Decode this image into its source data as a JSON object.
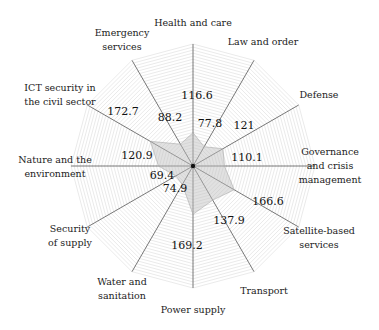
{
  "chart_data": {
    "type": "radar",
    "title": "",
    "center": [
      193,
      166
    ],
    "outer_radius_px": 122,
    "rmax": 427,
    "grid_rings": 40,
    "grid_color": "#d4d4d4",
    "axis_color": "#555555",
    "fill_color": "#bdbdbd",
    "fill_opacity": 0.45,
    "categories": [
      "Health and care",
      "Law and order",
      "Defense",
      "Governance and crisis management",
      "Satellite-based services",
      "Transport",
      "Power supply",
      "Water and sanitation",
      "Security of supply",
      "Nature and the environment",
      "ICT security in the civil sector",
      "Emergency services"
    ],
    "values": [
      116.6,
      77.8,
      121,
      110.1,
      166.6,
      137.9,
      169.2,
      74.9,
      69.4,
      120.9,
      172.7,
      88.2
    ],
    "value_labels": [
      "116.6",
      "77.8",
      "121",
      "110.1",
      "166.6",
      "137.9",
      "169.2",
      "74.9",
      "69.4",
      "120.9",
      "172.7",
      "88.2"
    ],
    "value_label_positions": [
      [
        197,
        99
      ],
      [
        210,
        127
      ],
      [
        244,
        129
      ],
      [
        247,
        161
      ],
      [
        268,
        205
      ],
      [
        229,
        224
      ],
      [
        187,
        249
      ],
      [
        175,
        192
      ],
      [
        162,
        179
      ],
      [
        137,
        159
      ],
      [
        123,
        115
      ],
      [
        170,
        121
      ]
    ],
    "axis_label_lines": [
      [
        "Health and care"
      ],
      [
        "Law and order"
      ],
      [
        "Defense"
      ],
      [
        "Governance",
        "and crisis",
        "management"
      ],
      [
        "Satellite-based",
        "services"
      ],
      [
        "Transport"
      ],
      [
        "Power supply"
      ],
      [
        "Water and",
        "sanitation"
      ],
      [
        "Security",
        "of supply"
      ],
      [
        "Nature and the",
        "environment"
      ],
      [
        "ICT security in",
        "the civil sector"
      ],
      [
        "Emergency",
        "services"
      ]
    ],
    "axis_label_positions": [
      [
        193,
        26
      ],
      [
        263,
        45
      ],
      [
        319,
        98
      ],
      [
        330,
        155
      ],
      [
        319,
        234
      ],
      [
        264,
        294
      ],
      [
        193,
        313
      ],
      [
        122,
        285
      ],
      [
        70,
        232
      ],
      [
        55,
        163
      ],
      [
        60,
        91
      ],
      [
        122,
        36
      ]
    ],
    "legend": null
  }
}
